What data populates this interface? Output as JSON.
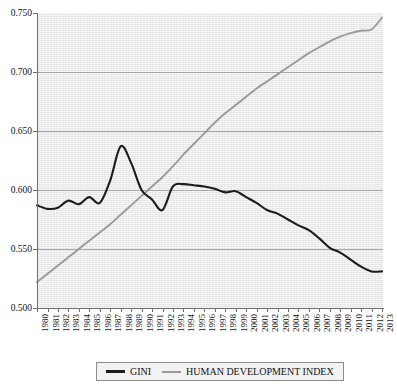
{
  "chart_data": {
    "type": "line",
    "title": "",
    "subtitle": "",
    "xlabel": "",
    "ylabel": "",
    "grid": true,
    "legend_position": "bottom",
    "xlim": [
      1980,
      2013
    ],
    "ylim": [
      0.5,
      0.75
    ],
    "ytick_labels": [
      "0.750",
      "0.700",
      "0.650",
      "0.600",
      "0.550",
      "0.500"
    ],
    "ytick_values": [
      0.75,
      0.7,
      0.65,
      0.6,
      0.55,
      0.5
    ],
    "categories": [
      "1980",
      "1981",
      "1982",
      "1983",
      "1984",
      "1985",
      "1986",
      "1987",
      "1988",
      "1989",
      "1990",
      "1991",
      "1992",
      "1993",
      "1994",
      "1995",
      "1996",
      "1997",
      "1998",
      "1999",
      "2000",
      "2001",
      "2002",
      "2003",
      "2004",
      "2005",
      "2006",
      "2007",
      "2008",
      "2009",
      "2010",
      "2011",
      "2012",
      "2013"
    ],
    "series": [
      {
        "name": "GINI",
        "color": "#1c1c1c",
        "values": [
          0.587,
          0.584,
          0.585,
          0.591,
          0.588,
          0.594,
          0.589,
          0.608,
          0.637,
          0.623,
          0.6,
          0.592,
          0.583,
          0.603,
          0.605,
          0.604,
          0.603,
          0.601,
          0.598,
          0.599,
          0.594,
          0.589,
          0.583,
          0.58,
          0.575,
          0.57,
          0.566,
          0.559,
          0.551,
          0.547,
          0.541,
          0.535,
          0.531,
          0.531
        ]
      },
      {
        "name": "HUMAN DEVELOPMENT INDEX",
        "color": "#9a9a9a",
        "values": [
          0.522,
          0.529,
          0.536,
          0.543,
          0.55,
          0.557,
          0.564,
          0.571,
          0.579,
          0.587,
          0.595,
          0.603,
          0.611,
          0.62,
          0.63,
          0.639,
          0.648,
          0.657,
          0.665,
          0.672,
          0.679,
          0.686,
          0.692,
          0.698,
          0.704,
          0.71,
          0.716,
          0.721,
          0.726,
          0.73,
          0.733,
          0.735,
          0.736,
          0.746
        ]
      }
    ]
  },
  "legend": {
    "entries": [
      {
        "label": "GINI",
        "swatch": "line-swatch-dark"
      },
      {
        "label": "HUMAN DEVELOPMENT INDEX",
        "swatch": "line-swatch-gray"
      }
    ]
  }
}
